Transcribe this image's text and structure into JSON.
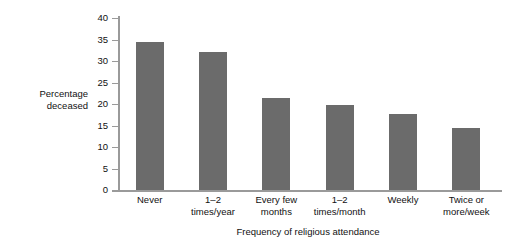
{
  "chart_data": {
    "type": "bar",
    "title": "",
    "xlabel": "Frequency of religious attendance",
    "ylabel": "Percentage deceased",
    "ylabel_lines": [
      "Percentage",
      "deceased"
    ],
    "categories": [
      "Never",
      "1–2\ntimes/year",
      "Every few\nmonths",
      "1–2\ntimes/month",
      "Weekly",
      "Twice or\nmore/week"
    ],
    "values": [
      34.5,
      32.0,
      21.5,
      19.7,
      17.7,
      14.5
    ],
    "ylim": [
      0,
      40
    ],
    "ytick_values": [
      0,
      5,
      10,
      15,
      20,
      25,
      30,
      35,
      40
    ],
    "ytick_labels": [
      "0",
      "5",
      "10",
      "15",
      "20",
      "25",
      "30",
      "35",
      "40"
    ],
    "grid": false,
    "legend": null,
    "bar_color": "#6b6b6b",
    "axis_color": "#9a9a9a",
    "background_color": "#ffffff"
  }
}
